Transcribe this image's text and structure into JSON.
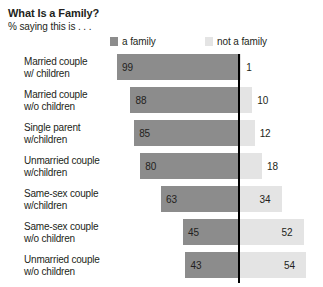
{
  "header": {
    "title": "What Is a Family?",
    "subtitle": "% saying this is . . ."
  },
  "legend": {
    "family": {
      "label": "a family",
      "color": "#8c8c8c",
      "swatch": "legend-swatch-dark"
    },
    "not_family": {
      "label": "not a family",
      "color": "#e4e4e4",
      "swatch": "legend-swatch-light"
    }
  },
  "chart_data": {
    "type": "bar",
    "title": "What Is a Family?",
    "subtitle": "% saying this is . . .",
    "xlabel": "",
    "ylabel": "",
    "orientation": "horizontal",
    "layout": "diverging-stacked",
    "grid": false,
    "legend_position": "top",
    "axis_divider": true,
    "units": "percent",
    "categories": [
      "Married couple w/ children",
      "Married couple w/o children",
      "Single parent w/children",
      "Unmarried couple w/children",
      "Same-sex couple w/children",
      "Same-sex couple w/o children",
      "Unmarried couple w/o children"
    ],
    "category_lines": [
      [
        "Married couple",
        "w/ children"
      ],
      [
        "Married couple",
        "w/o children"
      ],
      [
        "Single parent",
        "w/children"
      ],
      [
        "Unmarried couple",
        "w/children"
      ],
      [
        "Same-sex couple",
        "w/children"
      ],
      [
        "Same-sex couple",
        "w/o children"
      ],
      [
        "Unmarried couple",
        "w/o children"
      ]
    ],
    "series": [
      {
        "name": "a family",
        "color": "#8c8c8c",
        "values": [
          99,
          88,
          85,
          80,
          63,
          45,
          43
        ]
      },
      {
        "name": "not a family",
        "color": "#e4e4e4",
        "values": [
          1,
          10,
          12,
          18,
          34,
          52,
          54
        ]
      }
    ],
    "xlim": [
      0,
      100
    ]
  },
  "rows": [
    {
      "line1": "Married couple",
      "line2": "w/ children",
      "left": "99",
      "right": "1"
    },
    {
      "line1": "Married couple",
      "line2": "w/o children",
      "left": "88",
      "right": "10"
    },
    {
      "line1": "Single parent",
      "line2": "w/children",
      "left": "85",
      "right": "12"
    },
    {
      "line1": "Unmarried couple",
      "line2": "w/children",
      "left": "80",
      "right": "18"
    },
    {
      "line1": "Same-sex couple",
      "line2": "w/children",
      "left": "63",
      "right": "34"
    },
    {
      "line1": "Same-sex couple",
      "line2": "w/o children",
      "left": "45",
      "right": "52"
    },
    {
      "line1": "Unmarried couple",
      "line2": "w/o children",
      "left": "43",
      "right": "54"
    }
  ]
}
